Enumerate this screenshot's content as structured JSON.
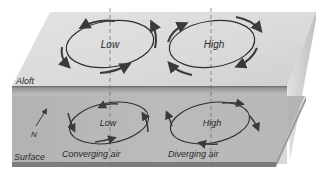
{
  "diagram": {
    "layers": {
      "aloft": "Aloft",
      "surface": "Surface"
    },
    "aloft_systems": [
      {
        "label": "Low",
        "circulation": "counterclockwise"
      },
      {
        "label": "High",
        "circulation": "clockwise"
      }
    ],
    "surface_systems": [
      {
        "label": "Low",
        "circulation": "counterclockwise inward",
        "caption": "Converging air"
      },
      {
        "label": "High",
        "circulation": "clockwise outward",
        "caption": "Diverging air"
      }
    ],
    "north_label": "N",
    "colors": {
      "top_face": "#d9d9d9",
      "front_face_dark": "#6e6e6e",
      "surface": "#b8b8b8",
      "slab_edge": "#7a7a7a",
      "arrow": "#3a3a3a"
    }
  }
}
